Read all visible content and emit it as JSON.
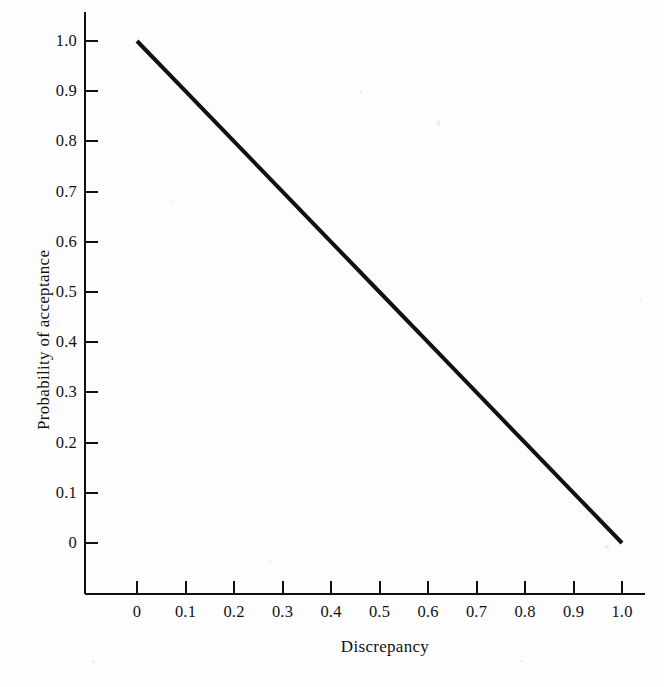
{
  "figure": {
    "width": 664,
    "height": 687,
    "background_color": "#fdfdfd",
    "ink_color": "#111111"
  },
  "chart_data": {
    "type": "line",
    "title": "",
    "subtitle": "",
    "xlabel": "Discrepancy",
    "ylabel": "Probability of acceptance",
    "xlim": [
      0,
      1.0
    ],
    "ylim": [
      0,
      1.0
    ],
    "grid": false,
    "legend": null,
    "legend_position": "none",
    "annotations": [],
    "x_ticks": [
      "0",
      "0.1",
      "0.2",
      "0.3",
      "0.4",
      "0.5",
      "0.6",
      "0.7",
      "0.8",
      "0.9",
      "1.0"
    ],
    "y_ticks": [
      "0",
      "0.1",
      "0.2",
      "0.3",
      "0.4",
      "0.5",
      "0.6",
      "0.7",
      "0.8",
      "0.9",
      "1.0"
    ],
    "x_tick_values": [
      0,
      0.1,
      0.2,
      0.3,
      0.4,
      0.5,
      0.6,
      0.7,
      0.8,
      0.9,
      1.0
    ],
    "y_tick_values": [
      0,
      0.1,
      0.2,
      0.3,
      0.4,
      0.5,
      0.6,
      0.7,
      0.8,
      0.9,
      1.0
    ],
    "series": [
      {
        "name": "Probability of acceptance",
        "color": "#111111",
        "line_width": 4,
        "x": [
          0,
          0.1,
          0.2,
          0.3,
          0.4,
          0.5,
          0.6,
          0.7,
          0.8,
          0.9,
          1.0
        ],
        "values": [
          1.0,
          0.9,
          0.8,
          0.7,
          0.6,
          0.5,
          0.4,
          0.3,
          0.2,
          0.1,
          0.0
        ]
      }
    ]
  },
  "geometry": {
    "x_axis_y": 594,
    "y_axis_x": 85,
    "y_axis_top": 12,
    "x_axis_right": 645,
    "x0_px": 137,
    "x1_px": 622,
    "y0_px": 543,
    "y1_px": 41,
    "tick_length": 13,
    "line_start": {
      "x": 130,
      "y": 39
    },
    "line_end": {
      "x": 621,
      "y": 540
    }
  }
}
